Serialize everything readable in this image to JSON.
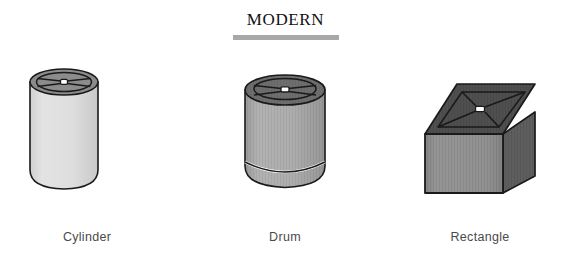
{
  "header": {
    "title": "MODERN",
    "rule_color": "#a8a8a8"
  },
  "palette": {
    "background": "#ffffff",
    "outline": "#1a1a1a",
    "title_text": "#111111",
    "caption_text": "#4a4a4a",
    "cylinder_body": "#dcdcdc",
    "cylinder_top": "#8c8c8c",
    "drum_body": "#a9a9a9",
    "drum_top": "#6e6e6e",
    "rect_front": "#8f8f8f",
    "rect_side": "#5e5e5e",
    "rect_top": "#4f4f4f",
    "spider_center": "#ffffff",
    "rim_highlight": "#ffffff"
  },
  "shades": [
    {
      "id": "cylinder",
      "label": "Cylinder",
      "shape": "cylinder",
      "body_color": "#dcdcdc",
      "top_color": "#8c8c8c",
      "has_spider": true,
      "has_rim_band": false,
      "textured": false
    },
    {
      "id": "drum",
      "label": "Drum",
      "shape": "drum",
      "body_color": "#a9a9a9",
      "top_color": "#6e6e6e",
      "has_spider": true,
      "has_rim_band": true,
      "textured": true
    },
    {
      "id": "rectangle",
      "label": "Rectangle",
      "shape": "rectangular-box",
      "body_color": "#8f8f8f",
      "top_color": "#4f4f4f",
      "side_color": "#5e5e5e",
      "has_spider": true,
      "has_rim_band": false,
      "textured": true
    }
  ]
}
